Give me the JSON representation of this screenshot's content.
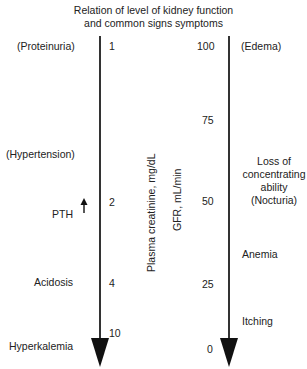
{
  "title": {
    "line1": "Relation of level of kidney function",
    "line2": "and common signs symptoms"
  },
  "left_axis": {
    "label": "Plasma creatinine, mg/dL",
    "ticks": [
      {
        "value": "1"
      },
      {
        "value": "2"
      },
      {
        "value": "4"
      },
      {
        "value": "10"
      }
    ]
  },
  "right_axis": {
    "label": "GFR, mL/min",
    "ticks": [
      {
        "value": "100"
      },
      {
        "value": "75"
      },
      {
        "value": "50"
      },
      {
        "value": "25"
      },
      {
        "value": "0"
      }
    ]
  },
  "left_signs": [
    {
      "label": "(Proteinuria)"
    },
    {
      "label": "(Hypertension)"
    },
    {
      "label": "PTH",
      "indicator": "up-arrow"
    },
    {
      "label": "Acidosis"
    },
    {
      "label": "Hyperkalemia"
    }
  ],
  "right_signs": [
    {
      "label": "(Edema)"
    },
    {
      "lines": [
        "Loss of",
        "concentrating",
        "ability",
        "(Nocturia)"
      ]
    },
    {
      "label": "Anemia"
    },
    {
      "label": "Itching"
    }
  ],
  "colors": {
    "axis": "#333333",
    "arrowhead": "#111111",
    "text": "#222222"
  }
}
